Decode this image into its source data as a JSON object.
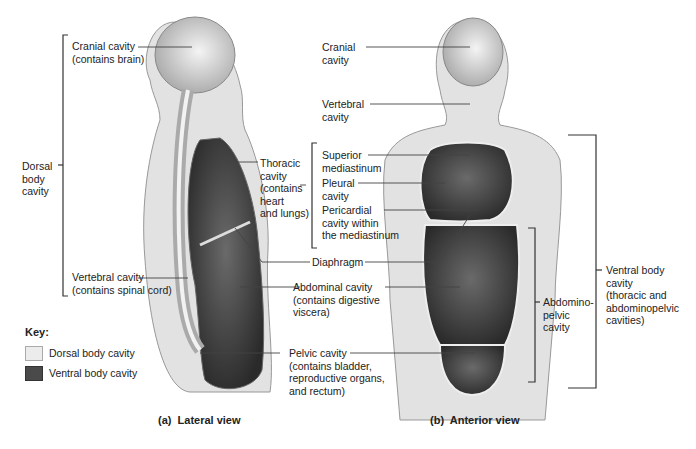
{
  "figure": {
    "lateral": {
      "caption": "(a)  Lateral view",
      "labels": {
        "cranial": "Cranial cavity\n(contains brain)",
        "dorsal": "Dorsal\nbody\ncavity",
        "thoracic": "Thoracic\ncavity\n(contains\nheart\nand lungs)",
        "diaphragm": "Diaphragm",
        "vertebral": "Vertebral cavity\n(contains spinal cord)",
        "abdominal": "Abdominal cavity\n(contains digestive\nviscera)",
        "pelvic": "Pelvic cavity\n(contains bladder,\nreproductive organs,\nand rectum)"
      }
    },
    "anterior": {
      "caption": "(b)  Anterior view",
      "labels": {
        "cranial": "Cranial\ncavity",
        "vertebral": "Vertebral\ncavity",
        "superior_mediastinum": "Superior\nmediastinum",
        "pleural": "Pleural\ncavity",
        "pericardial": "Pericardial\ncavity within\nthe mediastinum",
        "abdominopelvic": "Abdomino-\npelvic\ncavity",
        "ventral": "Ventral body\ncavity\n(thoracic and\nabdominopelvic\ncavities)"
      }
    },
    "key": {
      "title": "Key:",
      "items": [
        {
          "label": "Dorsal body cavity",
          "color": "#ececec"
        },
        {
          "label": "Ventral body cavity",
          "color": "#4a4a4a"
        }
      ]
    }
  }
}
